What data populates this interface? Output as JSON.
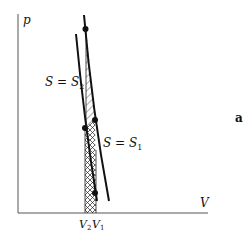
{
  "figure": {
    "panel_label": "a",
    "axes": {
      "y_label": "p",
      "x_label": "V"
    },
    "curves": [
      {
        "name": "adiabat-s2",
        "label": "S = S",
        "subscript": "2"
      },
      {
        "name": "adiabat-s1",
        "label": "S = S",
        "subscript": "1"
      }
    ],
    "x_ticks": [
      {
        "label": "V",
        "subscript": "2"
      },
      {
        "label": "V",
        "subscript": "1"
      }
    ],
    "colors": {
      "line": "#111111",
      "axis": "#555555",
      "background": "#ffffff"
    }
  }
}
